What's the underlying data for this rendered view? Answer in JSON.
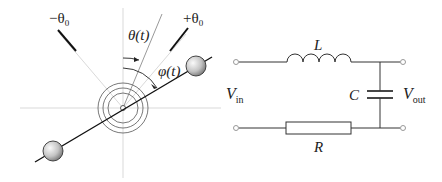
{
  "pendulum": {
    "labels": {
      "minus_theta0": "−θ",
      "minus_theta0_sub": "0",
      "plus_theta0": "+θ",
      "plus_theta0_sub": "0",
      "theta_t": "θ(t)",
      "phi_t": "φ(t)"
    },
    "colors": {
      "line": "#111111",
      "guide": "#c8c8c8",
      "ball_light": "#f4f4f4",
      "ball_dark": "#8a8a8a"
    }
  },
  "circuit": {
    "labels": {
      "inductor": "L",
      "capacitor": "C",
      "resistor": "R",
      "v_in": "V",
      "v_in_sub": "in",
      "v_out": "V",
      "v_out_sub": "out"
    },
    "colors": {
      "wire": "#333333",
      "terminal": "#999999"
    }
  }
}
